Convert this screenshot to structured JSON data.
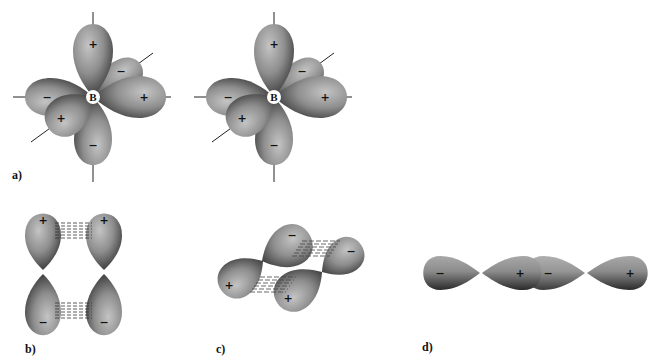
{
  "figure": {
    "colors": {
      "lobe_light": "#b8b8b8",
      "lobe_mid": "#8a8a8a",
      "lobe_dark": "#2a2a2a",
      "axis": "#222222",
      "background": "#ffffff"
    }
  },
  "panels": [
    {
      "id": "a",
      "label": "a)",
      "atom_label": "B",
      "structures": [
        {
          "center_atom": "B",
          "lobe_signs": [
            "+",
            "−",
            "+",
            "−",
            "+",
            "−"
          ]
        },
        {
          "center_atom": "B",
          "lobe_signs": [
            "+",
            "−",
            "+",
            "−",
            "+",
            "−"
          ]
        }
      ]
    },
    {
      "id": "b",
      "label": "b)",
      "type": "side-by-side p orbital overlap (pi bond)",
      "signs_top": [
        "+",
        "+"
      ],
      "signs_bottom": [
        "−",
        "−"
      ]
    },
    {
      "id": "c",
      "label": "c)",
      "type": "tilted p orbital overlap",
      "signs_top": [
        "−",
        "−"
      ],
      "signs_bottom": [
        "+",
        "+"
      ]
    },
    {
      "id": "d",
      "label": "d)",
      "type": "end-to-end p orbital overlap (sigma bond)",
      "signs": [
        "−",
        "+",
        "−",
        "+"
      ]
    }
  ]
}
